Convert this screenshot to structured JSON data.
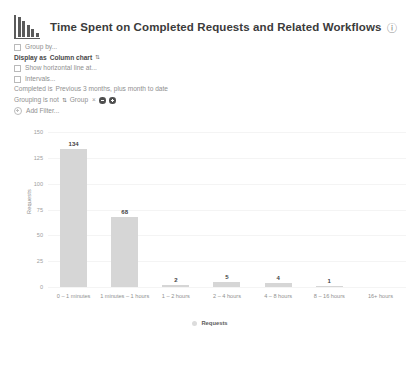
{
  "header": {
    "icon": "bar-chart-icon",
    "title": "Time Spent on Completed Requests and Related Workflows",
    "info_icon": "ⓘ"
  },
  "options": {
    "group_by": "Group by...",
    "display_as_label": "Display as",
    "display_as_value": "Column chart",
    "display_as_caret": "⇅",
    "show_horizontal_line": "Show horizontal line at...",
    "intervals": "Intervals...",
    "completed_label": "Completed is",
    "completed_value": "Previous 3 months, plus month to date",
    "grouping_label": "Grouping is not",
    "grouping_caret": "⇅",
    "grouping_value": "Group",
    "grouping_remove": "×",
    "add_filter": "Add Filter..."
  },
  "chart_data": {
    "type": "bar",
    "title": "Time Spent on Completed Requests and Related Workflows",
    "xlabel": "",
    "ylabel": "Requests",
    "categories": [
      "0 – 1 minutes",
      "1 minutes – 1 hours",
      "1 – 2 hours",
      "2 – 4 hours",
      "4 – 8 hours",
      "8 – 16 hours",
      "16+ hours"
    ],
    "values": [
      134,
      68,
      2,
      5,
      4,
      1,
      0
    ],
    "value_labels": [
      "134",
      "68",
      "2",
      "5",
      "4",
      "1",
      ""
    ],
    "ylim": [
      0,
      150
    ],
    "yticks": [
      150,
      125,
      100,
      75,
      50,
      25,
      0
    ],
    "grid": true,
    "legend": [
      "Requests"
    ],
    "legend_position": "bottom",
    "bar_color": "#d6d6d6",
    "series": [
      {
        "name": "Requests",
        "values": [
          134,
          68,
          2,
          5,
          4,
          1,
          0
        ]
      }
    ]
  }
}
